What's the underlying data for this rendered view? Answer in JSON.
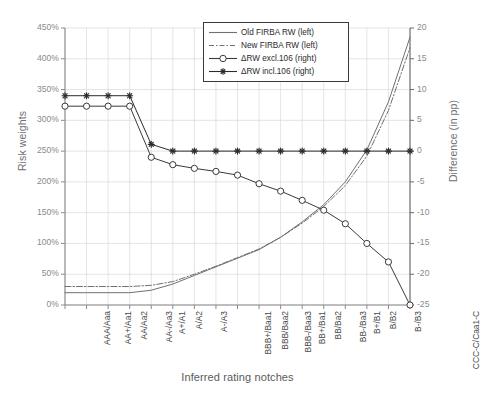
{
  "chart_data": {
    "type": "line",
    "title": "",
    "xlabel": "Inferred rating notches",
    "ylabel": "Risk weights",
    "ylabel_right": "Difference (in pp)",
    "grid": true,
    "legend_position": "top-center",
    "categories": [
      "AAA/Aaa",
      "AA+/Aa1",
      "AA/Aa2",
      "AA-/Aa3",
      "A+/A1",
      "A/A2",
      "A-/A3",
      "BBB+/Baa1",
      "BBB/Baa2",
      "BBB-/Baa3",
      "BB+/Ba1",
      "BB/Ba2",
      "BB-/Ba3",
      "B+/B1",
      "B/B2",
      "B-/B3",
      "CCC-C/Caa1-C"
    ],
    "ylim_left": [
      0,
      450
    ],
    "yticks_left": [
      "0%",
      "50%",
      "100%",
      "150%",
      "200%",
      "250%",
      "300%",
      "350%",
      "400%",
      "450%"
    ],
    "ylim_right": [
      -25,
      20
    ],
    "yticks_right": [
      "-25",
      "-20",
      "-15",
      "-10",
      "-5",
      "0",
      "5",
      "10",
      "15",
      "20"
    ],
    "series": [
      {
        "name": "Old FIRBA RW (left)",
        "axis": "left",
        "style": "solid",
        "marker": "none",
        "color": "#707070",
        "values": [
          20,
          20,
          20,
          20,
          24,
          34,
          48,
          62,
          76,
          90,
          110,
          135,
          163,
          200,
          252,
          330,
          435
        ]
      },
      {
        "name": "New FIRBA RW (left)",
        "axis": "left",
        "style": "dash-dot",
        "marker": "none",
        "color": "#707070",
        "values": [
          30,
          30,
          30,
          30,
          32,
          38,
          50,
          63,
          77,
          91,
          110,
          133,
          160,
          194,
          242,
          316,
          418
        ]
      },
      {
        "name": "ΔRW excl.106 (right)",
        "axis": "right",
        "style": "solid",
        "marker": "circle",
        "color": "#3a3a3a",
        "values": [
          7.3,
          7.3,
          7.3,
          7.3,
          -1.0,
          -2.2,
          -2.8,
          -3.3,
          -3.9,
          -5.3,
          -6.5,
          -8.0,
          -9.6,
          -11.8,
          -15.0,
          -18.0,
          -25.0
        ]
      },
      {
        "name": "ΔRW incl.106 (right)",
        "axis": "right",
        "style": "solid",
        "marker": "star",
        "color": "#2b2b2b",
        "values": [
          9.0,
          9.0,
          9.0,
          9.0,
          1.1,
          0.0,
          0.0,
          0.0,
          0.0,
          0.0,
          0.0,
          0.0,
          0.0,
          0.0,
          0.0,
          0.0,
          0.0
        ]
      }
    ]
  },
  "legend": {
    "items": [
      {
        "label": "Old FIRBA RW (left)"
      },
      {
        "label": "New FIRBA RW (left)"
      },
      {
        "label": "ΔRW excl.106 (right)"
      },
      {
        "label": "ΔRW incl.106 (right)"
      }
    ]
  }
}
